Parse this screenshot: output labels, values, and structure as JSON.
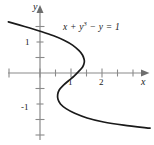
{
  "figure": {
    "kind": "math-graph",
    "width": 154,
    "height": 145,
    "background_color": "#ffffff",
    "curve_color": "#1a1a1a",
    "axis_color": "#808080",
    "text_color": "#1a1a1a"
  },
  "labels": {
    "y_axis": "y",
    "x_axis": "x",
    "y_tick_positive_one": "1",
    "y_tick_negative_one": "-1",
    "x_tick_one": "1",
    "x_tick_two": "2",
    "equation_lhs_part1": "x + y",
    "equation_exponent": "3",
    "equation_rhs_part": " − y = 1"
  },
  "chart_data": {
    "type": "line",
    "title": "",
    "xlabel": "x",
    "ylabel": "y",
    "equation": "x + y^3 - y = 1",
    "equation_display": "x + y³ − y = 1",
    "grid": false,
    "legend": false,
    "xlim": [
      -1.0,
      3.5
    ],
    "ylim": [
      -2.0,
      2.0
    ],
    "x_ticks": [
      -1,
      1,
      2,
      3
    ],
    "x_tick_labels": [
      "",
      "1",
      "2",
      ""
    ],
    "y_ticks": [
      -1.5,
      -1,
      -0.5,
      0.5,
      1,
      1.5
    ],
    "y_tick_labels": [
      "",
      "-1",
      "",
      "",
      "1",
      ""
    ],
    "series": [
      {
        "name": "x + y^3 - y = 1",
        "parametric_in_y": true,
        "x_of_y": "1 + y - y^3",
        "points": [
          {
            "x": -1.02,
            "y": 1.65
          },
          {
            "x": -0.5,
            "y": 1.5
          },
          {
            "x": 0.06,
            "y": 1.33
          },
          {
            "x": 0.44,
            "y": 1.2
          },
          {
            "x": 0.79,
            "y": 1.05
          },
          {
            "x": 1.05,
            "y": 0.9
          },
          {
            "x": 1.26,
            "y": 0.72
          },
          {
            "x": 1.37,
            "y": 0.58
          },
          {
            "x": 1.42,
            "y": 0.45
          },
          {
            "x": 1.43,
            "y": 0.35
          },
          {
            "x": 1.38,
            "y": 0.2
          },
          {
            "x": 1.25,
            "y": 0.05
          },
          {
            "x": 1.1,
            "y": -0.1
          },
          {
            "x": 0.92,
            "y": -0.25
          },
          {
            "x": 0.75,
            "y": -0.4
          },
          {
            "x": 0.62,
            "y": -0.55
          },
          {
            "x": 0.57,
            "y": -0.7
          },
          {
            "x": 0.58,
            "y": -0.85
          },
          {
            "x": 0.66,
            "y": -1.0
          },
          {
            "x": 0.84,
            "y": -1.15
          },
          {
            "x": 1.12,
            "y": -1.3
          },
          {
            "x": 1.52,
            "y": -1.45
          },
          {
            "x": 2.05,
            "y": -1.58
          },
          {
            "x": 2.7,
            "y": -1.68
          },
          {
            "x": 3.55,
            "y": -1.78
          }
        ]
      }
    ]
  }
}
